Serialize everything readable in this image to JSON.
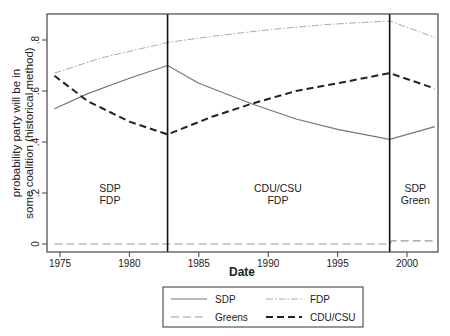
{
  "chart_data": {
    "type": "line",
    "title": "",
    "xlabel": "Date",
    "ylabel": [
      "probability party will be in",
      "some coalition (historical method)"
    ],
    "xlim": [
      1974,
      2002.5
    ],
    "ylim": [
      -0.03,
      0.9
    ],
    "x_ticks": [
      1975,
      1980,
      1985,
      1990,
      1995,
      2000
    ],
    "y_ticks": [
      0,
      0.2,
      0.4,
      0.6,
      0.8
    ],
    "y_tick_labels": [
      "0",
      ".2",
      ".4",
      ".6",
      ".8"
    ],
    "grid": false,
    "legend_position": "bottom",
    "period_dividers": [
      1982.75,
      1998.75
    ],
    "period_labels": [
      {
        "x": 1978.6,
        "lines": [
          "SDP",
          "FDP"
        ]
      },
      {
        "x": 1990.7,
        "lines": [
          "CDU/CSU",
          "FDP"
        ]
      },
      {
        "x": 2000.6,
        "lines": [
          "SDP",
          "Green"
        ]
      }
    ],
    "series": [
      {
        "name": "SDP",
        "style": "solid",
        "color": "#777777",
        "x": [
          1974.6,
          1977,
          1980,
          1982.75,
          1985,
          1988.8,
          1992,
          1995,
          1998.75,
          2002
        ],
        "values": [
          0.53,
          0.59,
          0.65,
          0.7,
          0.63,
          0.55,
          0.49,
          0.45,
          0.41,
          0.46
        ]
      },
      {
        "name": "FDP",
        "style": "dash-dot",
        "color": "#aaaaaa",
        "x": [
          1974.6,
          1978,
          1982.75,
          1986,
          1990,
          1994,
          1998.75,
          2002
        ],
        "values": [
          0.67,
          0.73,
          0.79,
          0.815,
          0.84,
          0.86,
          0.875,
          0.81
        ]
      },
      {
        "name": "Greens",
        "style": "long-dash",
        "color": "#999999",
        "x": [
          1974.6,
          1982.75,
          1998.75,
          1998.9,
          2002
        ],
        "values": [
          0.0,
          0.0,
          0.0,
          0.012,
          0.012
        ]
      },
      {
        "name": "CDU/CSU",
        "style": "dashed-bold",
        "color": "#222222",
        "x": [
          1974.6,
          1977,
          1980,
          1982.75,
          1986,
          1988.8,
          1992,
          1995,
          1998.75,
          2002
        ],
        "values": [
          0.66,
          0.56,
          0.48,
          0.43,
          0.5,
          0.55,
          0.6,
          0.63,
          0.67,
          0.61
        ]
      }
    ]
  },
  "legend": {
    "items": [
      {
        "label": "SDP"
      },
      {
        "label": "FDP"
      },
      {
        "label": "Greens"
      },
      {
        "label": "CDU/CSU"
      }
    ]
  }
}
